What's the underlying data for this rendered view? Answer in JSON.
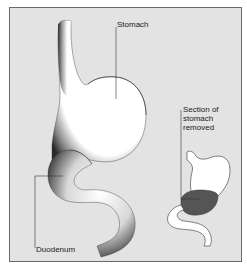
{
  "diagram": {
    "labels": {
      "stomach": "Stomach",
      "section_line1": "Section of",
      "section_line2": "stomach",
      "section_line3": "removed",
      "duodenum": "Duodenum"
    },
    "colors": {
      "background": "#e3e3e3",
      "border": "#6a6a6a",
      "organ_fill": "#ffffff",
      "removed_section": "#555555",
      "leader_line": "#333333"
    }
  }
}
